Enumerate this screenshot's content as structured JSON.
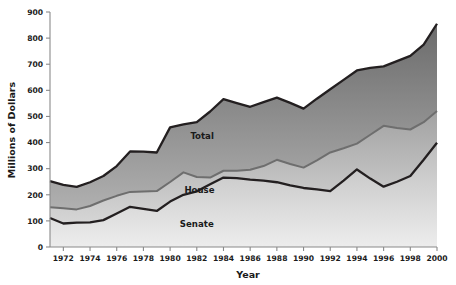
{
  "chart_data": {
    "type": "area",
    "title": "",
    "xlabel": "Year",
    "ylabel": "Millions of Dollars",
    "xlim": [
      1971,
      2000
    ],
    "ylim": [
      0,
      900
    ],
    "yticks": [
      0,
      100,
      200,
      300,
      400,
      500,
      600,
      700,
      800,
      900
    ],
    "xticks": [
      1972,
      1974,
      1976,
      1978,
      1980,
      1982,
      1984,
      1986,
      1988,
      1990,
      1992,
      1994,
      1996,
      1998,
      2000
    ],
    "xtick_labels": [
      "1972",
      "1974",
      "1976",
      "1978",
      "1980",
      "1982",
      "1984",
      "1986",
      "1988",
      "1990",
      "1992",
      "1994",
      "1996",
      "1998",
      "2000"
    ],
    "ytick_labels": [
      "0",
      "100",
      "200",
      "300",
      "400",
      "500",
      "600",
      "700",
      "800",
      "900"
    ],
    "grid": false,
    "legend": "inline-labels",
    "stacked": false,
    "x": [
      1971,
      1972,
      1973,
      1974,
      1975,
      1976,
      1977,
      1978,
      1979,
      1980,
      1981,
      1982,
      1983,
      1984,
      1985,
      1986,
      1987,
      1988,
      1989,
      1990,
      1991,
      1992,
      1993,
      1994,
      1995,
      1996,
      1997,
      1998,
      1999,
      2000
    ],
    "series": [
      {
        "name": "Total",
        "color": "#7a7a7a",
        "line_color": "#231f20",
        "values": [
          252,
          238,
          230,
          248,
          272,
          310,
          366,
          365,
          362,
          458,
          470,
          478,
          519,
          566,
          551,
          537,
          555,
          572,
          552,
          530,
          568,
          604,
          640,
          676,
          686,
          692,
          712,
          732,
          775,
          855
        ]
      },
      {
        "name": "House",
        "color": "#b6b6b6",
        "line_color": "#6e6e6e",
        "values": [
          152,
          148,
          144,
          157,
          178,
          196,
          211,
          213,
          214,
          249,
          286,
          268,
          266,
          292,
          292,
          296,
          310,
          334,
          318,
          304,
          332,
          362,
          378,
          396,
          430,
          464,
          456,
          450,
          478,
          521
        ]
      },
      {
        "name": "Senate",
        "color": "#c9c9c9",
        "line_color": "#231f20",
        "values": [
          111,
          90,
          93,
          94,
          103,
          128,
          154,
          146,
          138,
          174,
          200,
          213,
          240,
          266,
          264,
          258,
          254,
          248,
          236,
          226,
          221,
          214,
          254,
          297,
          262,
          231,
          250,
          272,
          334,
          399
        ]
      }
    ],
    "series_labels": [
      {
        "text": "Total",
        "x": 1982.4,
        "y": 414
      },
      {
        "text": "House",
        "x": 1982.2,
        "y": 206
      },
      {
        "text": "Senate",
        "x": 1982.0,
        "y": 78
      }
    ]
  },
  "axes": {
    "x_title": "Year",
    "y_title": "Millions of Dollars"
  },
  "colors": {
    "background": "#ffffff",
    "axis": "#8a8a8a",
    "text": "#1a1a1a",
    "total_line": "#231f20",
    "house_line": "#6e6e6e",
    "senate_line": "#231f20",
    "total_fill_top": "#6f6f6f",
    "total_fill_bottom": "#a8a8a8",
    "house_fill_top": "#a5a5a5",
    "house_fill_bottom": "#cfcfcf",
    "senate_fill_top": "#bfbfbf",
    "senate_fill_bottom": "#e6e6e6"
  }
}
